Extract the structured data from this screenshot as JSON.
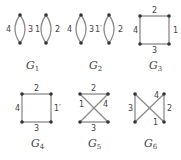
{
  "colors": {
    "edge": "#8a8a8a",
    "node": "#333333",
    "text": "#444444",
    "background": "#ffffff"
  },
  "graphs": [
    {
      "name": "G",
      "sub": "1",
      "type": "two-digons",
      "edge_labels": [
        "4",
        "3",
        "1",
        "2"
      ]
    },
    {
      "name": "G",
      "sub": "2",
      "type": "two-digons",
      "edge_labels": [
        "4",
        "3",
        "1′",
        "2"
      ]
    },
    {
      "name": "G",
      "sub": "3",
      "type": "square",
      "edge_labels": {
        "top": "2",
        "right": "1",
        "bottom": "3",
        "left": "4"
      }
    },
    {
      "name": "G",
      "sub": "4",
      "type": "square",
      "edge_labels": {
        "top": "2",
        "right": "1′",
        "bottom": "3",
        "left": "4"
      }
    },
    {
      "name": "G",
      "sub": "5",
      "type": "bowtie-horizontal",
      "edge_labels": {
        "top": "2",
        "bottom": "3",
        "diag_a": "1",
        "diag_b": "4"
      }
    },
    {
      "name": "G",
      "sub": "6",
      "type": "bowtie-vertical",
      "edge_labels": {
        "left": "3",
        "right": "2",
        "diag_a": "4",
        "diag_b": "1"
      }
    }
  ]
}
